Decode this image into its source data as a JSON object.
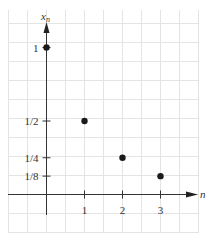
{
  "chart_data": {
    "type": "scatter",
    "title": "",
    "xlabel": "n",
    "ylabel": "x_n",
    "x_ticks": [
      "1",
      "2",
      "3"
    ],
    "y_ticks": [
      "1",
      "1/2",
      "1/4",
      "1/8"
    ],
    "x": [
      0,
      1,
      2,
      3
    ],
    "values": [
      1,
      0.5,
      0.25,
      0.125
    ],
    "grid": true,
    "legend": null,
    "colors": {
      "grid": "#e6e6e6",
      "axis": "#333333",
      "point": "#1a1a1a"
    }
  }
}
